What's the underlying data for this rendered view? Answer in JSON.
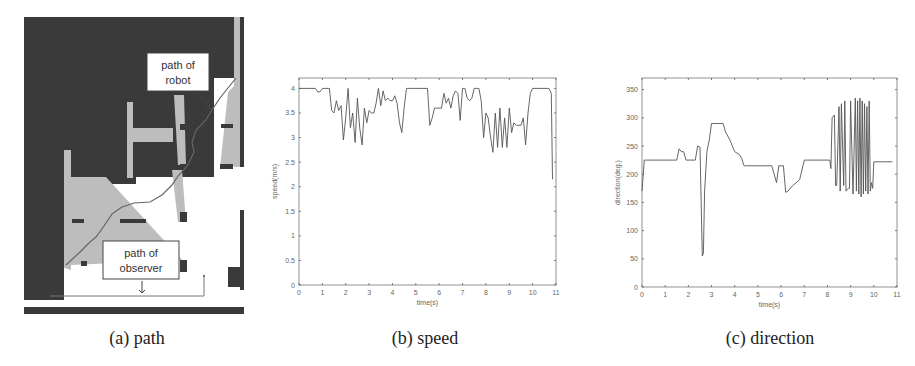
{
  "figure": {
    "panels": [
      {
        "id": "a",
        "caption": "(a) path",
        "labels": {
          "robot_line1": "path of",
          "robot_line2": "robot",
          "observer_line1": "path of",
          "observer_line2": "observer"
        }
      },
      {
        "id": "b",
        "caption": "(b) speed"
      },
      {
        "id": "c",
        "caption": "(c) direction"
      }
    ]
  },
  "colors": {
    "dark_region": "#3a3a3a",
    "light_region": "#bdbdbd",
    "line": "#555555",
    "axis": "#777777"
  },
  "chart_data": [
    {
      "type": "line",
      "title": "",
      "xlabel": "time(s)",
      "ylabel": "speed(m/s)",
      "xlim": [
        0,
        11
      ],
      "ylim": [
        0,
        4.1
      ],
      "xticks": [
        "0",
        "1",
        "2",
        "3",
        "4",
        "5",
        "6",
        "7",
        "8",
        "9",
        "10",
        "11"
      ],
      "yticks": [
        "0",
        "0.5",
        "1",
        "1.5",
        "2",
        "2.5",
        "3",
        "3.5",
        "4"
      ],
      "grid": false,
      "series": [
        {
          "name": "speed",
          "x": [
            0,
            0.7,
            0.8,
            0.9,
            1.0,
            1.3,
            1.4,
            1.5,
            1.6,
            1.7,
            1.8,
            1.9,
            2.0,
            2.1,
            2.2,
            2.3,
            2.4,
            2.5,
            2.6,
            2.7,
            2.8,
            2.9,
            3.0,
            3.1,
            3.2,
            3.3,
            3.4,
            3.5,
            3.6,
            3.7,
            3.8,
            3.9,
            4.0,
            4.1,
            4.2,
            4.3,
            4.4,
            4.5,
            4.6,
            4.7,
            4.8,
            5.0,
            5.5,
            5.6,
            5.7,
            5.8,
            5.9,
            6.0,
            6.1,
            6.2,
            6.3,
            6.4,
            6.5,
            6.6,
            6.7,
            6.8,
            6.9,
            7.0,
            7.1,
            7.2,
            7.3,
            7.4,
            7.5,
            7.6,
            7.7,
            7.8,
            7.9,
            8.0,
            8.1,
            8.2,
            8.3,
            8.4,
            8.5,
            8.6,
            8.7,
            8.8,
            8.9,
            9.0,
            9.1,
            9.2,
            9.3,
            9.4,
            9.5,
            9.6,
            9.7,
            9.8,
            9.9,
            10.0,
            10.7,
            10.8,
            10.85
          ],
          "values": [
            4.0,
            4.0,
            3.93,
            3.93,
            4.0,
            4.0,
            3.55,
            3.5,
            3.75,
            3.55,
            3.65,
            2.95,
            3.4,
            4.0,
            3.2,
            3.5,
            2.9,
            3.8,
            3.2,
            2.85,
            3.6,
            3.3,
            3.55,
            3.5,
            3.5,
            3.7,
            4.0,
            3.65,
            3.95,
            3.75,
            3.8,
            3.75,
            3.75,
            3.85,
            3.7,
            3.3,
            3.1,
            3.6,
            4.0,
            4.0,
            4.0,
            4.0,
            4.0,
            3.25,
            3.4,
            3.6,
            3.6,
            3.6,
            3.6,
            3.9,
            3.7,
            3.8,
            3.6,
            3.85,
            3.95,
            3.9,
            3.35,
            4.0,
            4.0,
            3.8,
            3.75,
            3.8,
            4.0,
            4.0,
            4.0,
            3.75,
            3.0,
            3.5,
            3.4,
            3.0,
            2.7,
            3.5,
            2.8,
            3.6,
            2.8,
            3.4,
            2.8,
            3.6,
            3.1,
            3.3,
            3.25,
            3.25,
            3.25,
            3.4,
            2.85,
            3.5,
            3.9,
            4.0,
            4.0,
            3.9,
            2.15
          ]
        }
      ]
    },
    {
      "type": "line",
      "title": "",
      "xlabel": "time(s)",
      "ylabel": "direction(deg.)",
      "xlim": [
        0,
        11
      ],
      "ylim": [
        0,
        360
      ],
      "xticks": [
        "0",
        "1",
        "2",
        "3",
        "4",
        "5",
        "6",
        "7",
        "8",
        "9",
        "10",
        "11"
      ],
      "yticks": [
        "0",
        "50",
        "100",
        "150",
        "200",
        "250",
        "300",
        "350"
      ],
      "grid": false,
      "series": [
        {
          "name": "direction",
          "x": [
            0,
            0.1,
            0.2,
            1.5,
            1.6,
            1.7,
            1.8,
            1.9,
            2.3,
            2.4,
            2.5,
            2.6,
            2.65,
            2.7,
            2.8,
            2.9,
            3.0,
            3.2,
            3.5,
            3.6,
            3.8,
            4.0,
            4.2,
            4.3,
            4.4,
            4.5,
            5.6,
            5.8,
            5.9,
            6.1,
            6.2,
            6.3,
            6.5,
            6.8,
            7.0,
            7.1,
            8.1,
            8.15,
            8.2,
            8.3,
            8.35,
            8.4,
            8.5,
            8.55,
            8.6,
            8.7,
            8.75,
            8.8,
            8.9,
            8.95,
            9.0,
            9.1,
            9.2,
            9.25,
            9.3,
            9.35,
            9.4,
            9.45,
            9.5,
            9.55,
            9.6,
            9.65,
            9.7,
            9.75,
            9.8,
            9.85,
            9.9,
            9.95,
            10.0,
            10.8
          ],
          "values": [
            170,
            225,
            225,
            225,
            245,
            240,
            240,
            225,
            225,
            250,
            248,
            55,
            60,
            170,
            240,
            260,
            290,
            290,
            290,
            275,
            260,
            240,
            235,
            228,
            215,
            215,
            215,
            185,
            215,
            215,
            168,
            170,
            180,
            190,
            225,
            225,
            225,
            210,
            300,
            305,
            180,
            180,
            320,
            170,
            325,
            180,
            330,
            170,
            175,
            175,
            330,
            165,
            335,
            170,
            330,
            165,
            335,
            160,
            330,
            165,
            325,
            170,
            320,
            165,
            330,
            170,
            185,
            175,
            222,
            222
          ]
        }
      ]
    }
  ]
}
